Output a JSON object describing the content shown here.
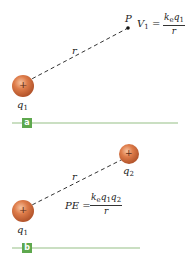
{
  "panels": [
    {
      "tag": "a",
      "charge_label": "q",
      "charge_sub": "1",
      "charge_sign": "+",
      "distance_label": "r",
      "point_label": "P",
      "equation": {
        "lhs": "V",
        "lhs_sub": "1",
        "eq": "=",
        "num": "k",
        "num_k_sub": "e",
        "num_q": "q",
        "num_q_sub": "1",
        "den": "r"
      }
    },
    {
      "tag": "b",
      "charge1_label": "q",
      "charge1_sub": "1",
      "charge2_label": "q",
      "charge2_sub": "2",
      "charge_sign": "+",
      "distance_label": "r",
      "equation": {
        "lhs": "PE",
        "eq": "=",
        "num_k": "k",
        "num_k_sub": "e",
        "num_q1": "q",
        "num_q1_sub": "1",
        "num_q2": "q",
        "num_q2_sub": "2",
        "den": "r"
      }
    }
  ],
  "colors": {
    "sphere": "#d9703f",
    "sphere_highlight": "#f4b48c",
    "tag_bg": "#5ea84e",
    "baseline": "#b9d4ae"
  }
}
